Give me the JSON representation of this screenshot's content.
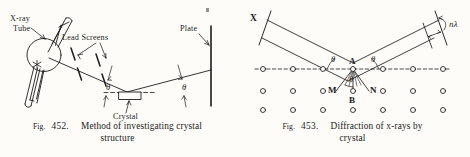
{
  "page": {
    "background": "#fdfcf8",
    "ink": "#1c1c1c",
    "width": 470,
    "height": 157
  },
  "figure_left": {
    "id": "fig-452",
    "caption": {
      "fig_word": "Fig.",
      "number": "452.",
      "line1": "Method of investigating crystal",
      "line2": "structure"
    },
    "labels": {
      "xray_tube_line1": "X-ray",
      "xray_tube_line2": "Tube",
      "lead_screens": "Lead Screens",
      "plate": "Plate",
      "crystal": "Crystal",
      "theta_incident": "θ",
      "theta_reflected": "θ"
    }
  },
  "figure_right": {
    "id": "fig-453",
    "caption": {
      "fig_word": "Fig.",
      "number": "453.",
      "line1": "Diffraction of x-rays by",
      "line2": "crystal"
    },
    "labels": {
      "x_beam": "X",
      "n_lambda": "nλ",
      "point_a": "A",
      "point_b": "B",
      "point_m": "M",
      "point_n": "N",
      "theta_left": "θ",
      "theta_right": "θ",
      "theta_lower": "θ"
    },
    "lattice": {
      "rows": 3,
      "columns_per_row": 7,
      "atom_radius": 2.4,
      "row_y": [
        69,
        91,
        110
      ],
      "note": "open circles representing crystal atoms"
    }
  }
}
